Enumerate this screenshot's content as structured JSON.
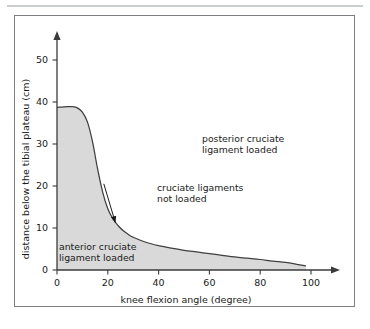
{
  "figure": {
    "frame_border_color": "#7d7f83",
    "top_rule_color": "#c9ccd1",
    "background": "#ffffff"
  },
  "chart_data": {
    "type": "area",
    "title": "",
    "subtitle": "",
    "xlabel": "knee flexion angle (degree)",
    "ylabel": "distance below the tibial plateau (cm)",
    "xlim": [
      0,
      105
    ],
    "ylim": [
      0,
      55
    ],
    "xticks": [
      0,
      20,
      40,
      60,
      80,
      100
    ],
    "xticklabels": [
      "0",
      "20",
      "40",
      "60",
      "80",
      "100"
    ],
    "yticks": [
      0,
      10,
      20,
      30,
      40,
      50
    ],
    "yticklabels": [
      "0",
      "10",
      "20",
      "30",
      "40",
      "50"
    ],
    "grid": false,
    "legend": null,
    "fill_color": "#d9d9d9",
    "line_color": "#3f3f3f",
    "axis_color": "#3b3b3b",
    "series": [
      {
        "name": "anterior cruciate ligament load boundary",
        "x": [
          0,
          2,
          4,
          6,
          8,
          10,
          12,
          14,
          16,
          18,
          20,
          22,
          24,
          26,
          28,
          30,
          35,
          40,
          45,
          50,
          55,
          60,
          65,
          70,
          75,
          80,
          85,
          90,
          95,
          98
        ],
        "y": [
          38.7,
          38.8,
          38.9,
          38.9,
          38.6,
          37.6,
          35.2,
          30.5,
          24.0,
          18.5,
          14.6,
          12.2,
          10.6,
          9.4,
          8.5,
          7.8,
          6.6,
          5.8,
          5.2,
          4.7,
          4.3,
          3.9,
          3.5,
          3.1,
          2.8,
          2.5,
          2.1,
          1.8,
          1.3,
          1.0
        ]
      }
    ],
    "annotations": [
      {
        "name": "posterior-region",
        "text_lines": [
          "posterior cruciate",
          "ligament loaded"
        ],
        "x": 30,
        "y": 32
      },
      {
        "name": "cruciate-free-region",
        "text_lines": [
          "cruciate ligaments",
          "not loaded"
        ],
        "x": 20,
        "y": 21,
        "arrow_to_x": 23,
        "arrow_to_y": 11
      },
      {
        "name": "anterior-region",
        "text_lines": [
          "anterior cruciate",
          "ligament loaded"
        ],
        "x": 1,
        "y": 7
      }
    ]
  }
}
